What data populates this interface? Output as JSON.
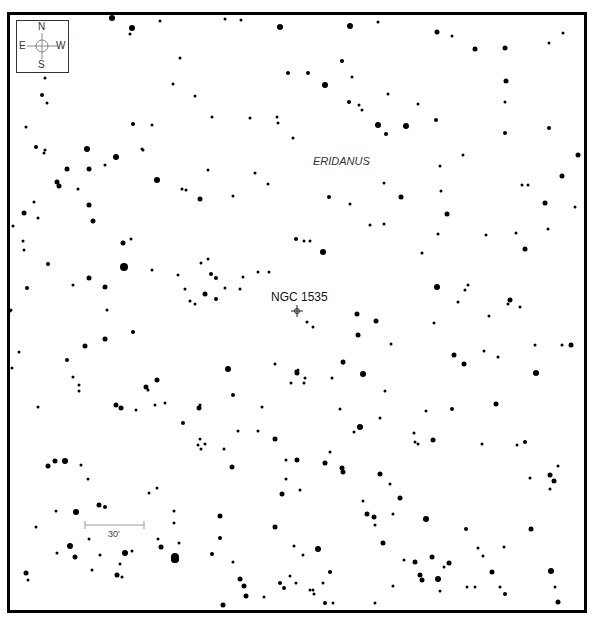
{
  "map": {
    "type": "finder_chart",
    "object_name": "NGC 1535",
    "object_pos": [
      297,
      311
    ],
    "constellation": "ERIDANUS",
    "constellation_pos": [
      313,
      162
    ],
    "frame": {
      "left": 7,
      "top": 12,
      "right": 586,
      "bottom": 610,
      "border_px": 3
    },
    "compass": {
      "north": "N",
      "south": "S",
      "east": "E",
      "west": "W",
      "center": [
        41,
        46
      ]
    },
    "scale_bar": {
      "label": "30'",
      "x1": 85,
      "x2": 144,
      "y": 525
    },
    "stars": [
      [
        112,
        18,
        3
      ],
      [
        132,
        28,
        3
      ],
      [
        130,
        34,
        1.5
      ],
      [
        160,
        21,
        1.5
      ],
      [
        225,
        19,
        1.5
      ],
      [
        241,
        20,
        1.5
      ],
      [
        280,
        27,
        3
      ],
      [
        350,
        26,
        3
      ],
      [
        378,
        22,
        1.5
      ],
      [
        437,
        32,
        2.5
      ],
      [
        452,
        36,
        1.5
      ],
      [
        549,
        43,
        1.5
      ],
      [
        563,
        33,
        1.5
      ],
      [
        45,
        78,
        1.5
      ],
      [
        42,
        95,
        2
      ],
      [
        47,
        103,
        1.5
      ],
      [
        26,
        127,
        1.5
      ],
      [
        36,
        147,
        2
      ],
      [
        44,
        153,
        1.5
      ],
      [
        87,
        149,
        3
      ],
      [
        116,
        157,
        3
      ],
      [
        133,
        124,
        2
      ],
      [
        142,
        149,
        1.5
      ],
      [
        143,
        150,
        1.5
      ],
      [
        152,
        125,
        1.5
      ],
      [
        180,
        58,
        1.5
      ],
      [
        173,
        84,
        1.5
      ],
      [
        195,
        96,
        1.5
      ],
      [
        212,
        117,
        1.5
      ],
      [
        250,
        118,
        1.5
      ],
      [
        277,
        117,
        1.5
      ],
      [
        278,
        123,
        1.5
      ],
      [
        288,
        73,
        2
      ],
      [
        308,
        73,
        2
      ],
      [
        325,
        85,
        3
      ],
      [
        342,
        61,
        2
      ],
      [
        352,
        77,
        1.5
      ],
      [
        349,
        102,
        2
      ],
      [
        359,
        105,
        1.5
      ],
      [
        362,
        110,
        1.5
      ],
      [
        388,
        94,
        1.5
      ],
      [
        378,
        125,
        3
      ],
      [
        386,
        134,
        2
      ],
      [
        406,
        126,
        3
      ],
      [
        418,
        104,
        1.5
      ],
      [
        436,
        120,
        2
      ],
      [
        475,
        49,
        2.5
      ],
      [
        505,
        48,
        2.5
      ],
      [
        506,
        81,
        2.5
      ],
      [
        505,
        102,
        1.5
      ],
      [
        505,
        133,
        2
      ],
      [
        549,
        128,
        2
      ],
      [
        578,
        155,
        2.5
      ],
      [
        45,
        150,
        1.5
      ],
      [
        67,
        169,
        2.5
      ],
      [
        57,
        182,
        2.5
      ],
      [
        59,
        186,
        2.5
      ],
      [
        89,
        169,
        2.5
      ],
      [
        89,
        205,
        2.5
      ],
      [
        93,
        221,
        2.5
      ],
      [
        105,
        165,
        1.5
      ],
      [
        78,
        189,
        1.5
      ],
      [
        34,
        202,
        1.5
      ],
      [
        24,
        213,
        2.5
      ],
      [
        38,
        218,
        1.5
      ],
      [
        13,
        226,
        1.5
      ],
      [
        23,
        241,
        1.5
      ],
      [
        157,
        180,
        3
      ],
      [
        182,
        189,
        1.5
      ],
      [
        186,
        190,
        1.5
      ],
      [
        200,
        199,
        2.5
      ],
      [
        208,
        170,
        1.5
      ],
      [
        255,
        173,
        1.5
      ],
      [
        268,
        184,
        1.5
      ],
      [
        233,
        196,
        1.5
      ],
      [
        329,
        197,
        2
      ],
      [
        350,
        204,
        1.5
      ],
      [
        384,
        183,
        1.5
      ],
      [
        401,
        197,
        2.5
      ],
      [
        441,
        191,
        1.5
      ],
      [
        440,
        166,
        1.5
      ],
      [
        463,
        155,
        1.5
      ],
      [
        522,
        185,
        1.5
      ],
      [
        528,
        185,
        1.5
      ],
      [
        545,
        203,
        2.5
      ],
      [
        562,
        176,
        2.5
      ],
      [
        575,
        207,
        1.5
      ],
      [
        447,
        214,
        2.5
      ],
      [
        293,
        138,
        1.5
      ],
      [
        24,
        250,
        1.5
      ],
      [
        27,
        288,
        2
      ],
      [
        48,
        264,
        2
      ],
      [
        73,
        285,
        1.5
      ],
      [
        89,
        278,
        2.5
      ],
      [
        105,
        287,
        2.5
      ],
      [
        124,
        267,
        4
      ],
      [
        123,
        243,
        2.5
      ],
      [
        131,
        239,
        1.5
      ],
      [
        152,
        270,
        1.5
      ],
      [
        178,
        275,
        1.5
      ],
      [
        185,
        289,
        1.5
      ],
      [
        201,
        263,
        1.5
      ],
      [
        208,
        259,
        1.5
      ],
      [
        211,
        274,
        2
      ],
      [
        216,
        278,
        2
      ],
      [
        225,
        288,
        1.5
      ],
      [
        243,
        277,
        1.5
      ],
      [
        258,
        272,
        1.5
      ],
      [
        269,
        272,
        1.5
      ],
      [
        216,
        299,
        2
      ],
      [
        205,
        294,
        2.5
      ],
      [
        190,
        301,
        1.5
      ],
      [
        195,
        304,
        1.5
      ],
      [
        240,
        289,
        1.5
      ],
      [
        296,
        239,
        2
      ],
      [
        304,
        241,
        1.5
      ],
      [
        310,
        241,
        1.5
      ],
      [
        323,
        252,
        3
      ],
      [
        370,
        225,
        1.5
      ],
      [
        384,
        224,
        1.5
      ],
      [
        438,
        234,
        1.5
      ],
      [
        422,
        253,
        1.5
      ],
      [
        486,
        235,
        1.5
      ],
      [
        516,
        233,
        1.5
      ],
      [
        525,
        249,
        2.5
      ],
      [
        548,
        229,
        1.5
      ],
      [
        437,
        287,
        3
      ],
      [
        465,
        290,
        1.5
      ],
      [
        468,
        285,
        1.5
      ],
      [
        458,
        302,
        1.5
      ],
      [
        510,
        300,
        2.5
      ],
      [
        11,
        310,
        1.5
      ],
      [
        10,
        311,
        1.5
      ],
      [
        19,
        352,
        1.5
      ],
      [
        12,
        368,
        1.5
      ],
      [
        38,
        407,
        1.5
      ],
      [
        67,
        360,
        2
      ],
      [
        73,
        377,
        1.5
      ],
      [
        79,
        385,
        1.5
      ],
      [
        79,
        391,
        1.5
      ],
      [
        85,
        346,
        2.5
      ],
      [
        105,
        339,
        2.5
      ],
      [
        107,
        310,
        1.5
      ],
      [
        133,
        332,
        2
      ],
      [
        146,
        387,
        2.5
      ],
      [
        157,
        380,
        2.5
      ],
      [
        148,
        390,
        1.5
      ],
      [
        155,
        405,
        1.5
      ],
      [
        165,
        403,
        1.5
      ],
      [
        116,
        405,
        2.5
      ],
      [
        121,
        408,
        2.5
      ],
      [
        136,
        410,
        1.5
      ],
      [
        199,
        408,
        2.5
      ],
      [
        200,
        405,
        1.5
      ],
      [
        183,
        423,
        2
      ],
      [
        200,
        439,
        1.5
      ],
      [
        198,
        445,
        1.5
      ],
      [
        201,
        449,
        1.5
      ],
      [
        205,
        444,
        1.5
      ],
      [
        224,
        449,
        1.5
      ],
      [
        228,
        369,
        3
      ],
      [
        233,
        395,
        2
      ],
      [
        238,
        431,
        1.5
      ],
      [
        258,
        431,
        1.5
      ],
      [
        275,
        439,
        2.5
      ],
      [
        297,
        373,
        2.5
      ],
      [
        298,
        370,
        1.5
      ],
      [
        305,
        378,
        1.5
      ],
      [
        275,
        364,
        1.5
      ],
      [
        296,
        371,
        1.5
      ],
      [
        307,
        322,
        1.5
      ],
      [
        313,
        327,
        1.5
      ],
      [
        357,
        314,
        2.5
      ],
      [
        358,
        335,
        2.5
      ],
      [
        376,
        321,
        2.5
      ],
      [
        343,
        362,
        2.5
      ],
      [
        343,
        363,
        1.5
      ],
      [
        363,
        374,
        3
      ],
      [
        332,
        378,
        1.5
      ],
      [
        391,
        344,
        1.5
      ],
      [
        434,
        323,
        1.5
      ],
      [
        454,
        355,
        2.5
      ],
      [
        464,
        364,
        2.5
      ],
      [
        484,
        351,
        1.5
      ],
      [
        498,
        357,
        1.5
      ],
      [
        536,
        373,
        3
      ],
      [
        535,
        345,
        1.5
      ],
      [
        562,
        345,
        1.5
      ],
      [
        571,
        345,
        2.5
      ],
      [
        489,
        316,
        1.5
      ],
      [
        520,
        307,
        1.5
      ],
      [
        508,
        304,
        1.5
      ],
      [
        496,
        404,
        2.5
      ],
      [
        426,
        411,
        1.5
      ],
      [
        380,
        418,
        1.5
      ],
      [
        340,
        409,
        1.5
      ],
      [
        360,
        427,
        3
      ],
      [
        354,
        432,
        1.5
      ],
      [
        452,
        409,
        2
      ],
      [
        433,
        440,
        2.5
      ],
      [
        418,
        444,
        1.5
      ],
      [
        414,
        433,
        1.5
      ],
      [
        482,
        444,
        1.5
      ],
      [
        517,
        445,
        1.5
      ],
      [
        525,
        442,
        2
      ],
      [
        262,
        407,
        1.5
      ],
      [
        385,
        391,
        1.5
      ],
      [
        304,
        383,
        1.5
      ],
      [
        291,
        383,
        1.5
      ],
      [
        48,
        466,
        2.5
      ],
      [
        55,
        461,
        2.5
      ],
      [
        65,
        461,
        3
      ],
      [
        81,
        465,
        1.5
      ],
      [
        88,
        479,
        1.5
      ],
      [
        56,
        511,
        1.5
      ],
      [
        76,
        512,
        3
      ],
      [
        99,
        505,
        2.5
      ],
      [
        105,
        507,
        2
      ],
      [
        36,
        527,
        1.5
      ],
      [
        70,
        546,
        3
      ],
      [
        57,
        553,
        1.5
      ],
      [
        75,
        557,
        2.5
      ],
      [
        89,
        539,
        1.5
      ],
      [
        100,
        555,
        1.5
      ],
      [
        125,
        553,
        3
      ],
      [
        132,
        551,
        1.5
      ],
      [
        92,
        570,
        1.5
      ],
      [
        117,
        575,
        2.5
      ],
      [
        122,
        577,
        1.5
      ],
      [
        26,
        573,
        2.5
      ],
      [
        28,
        580,
        1.5
      ],
      [
        149,
        493,
        1.5
      ],
      [
        157,
        488,
        1.5
      ],
      [
        174,
        511,
        1.5
      ],
      [
        174,
        523,
        1.5
      ],
      [
        158,
        539,
        1.5
      ],
      [
        161,
        547,
        2.5
      ],
      [
        179,
        543,
        1.5
      ],
      [
        175,
        559,
        4
      ],
      [
        175,
        559,
        4
      ],
      [
        232,
        467,
        2.5
      ],
      [
        220,
        516,
        2.5
      ],
      [
        220,
        538,
        2
      ],
      [
        212,
        554,
        2
      ],
      [
        233,
        562,
        1.5
      ],
      [
        240,
        579,
        2.5
      ],
      [
        246,
        596,
        2.5
      ],
      [
        264,
        597,
        1.5
      ],
      [
        286,
        460,
        1.5
      ],
      [
        297,
        460,
        2.5
      ],
      [
        300,
        490,
        1.5
      ],
      [
        325,
        463,
        2.5
      ],
      [
        343,
        472,
        2.5
      ],
      [
        363,
        501,
        1.5
      ],
      [
        367,
        514,
        2.5
      ],
      [
        380,
        474,
        2.5
      ],
      [
        390,
        484,
        1.5
      ],
      [
        393,
        514,
        1.5
      ],
      [
        286,
        479,
        1.5
      ],
      [
        282,
        494,
        2.5
      ],
      [
        275,
        527,
        2.5
      ],
      [
        294,
        546,
        1.5
      ],
      [
        318,
        549,
        3
      ],
      [
        330,
        572,
        2
      ],
      [
        323,
        583,
        1.5
      ],
      [
        303,
        555,
        1.5
      ],
      [
        296,
        583,
        1.5
      ],
      [
        314,
        594,
        1.5
      ],
      [
        313,
        590,
        1.5
      ],
      [
        325,
        603,
        2
      ],
      [
        374,
        517,
        2.5
      ],
      [
        375,
        525,
        1.5
      ],
      [
        383,
        543,
        2.5
      ],
      [
        404,
        560,
        1.5
      ],
      [
        415,
        562,
        2.5
      ],
      [
        432,
        557,
        2.5
      ],
      [
        444,
        567,
        1.5
      ],
      [
        440,
        591,
        1.5
      ],
      [
        393,
        586,
        1.5
      ],
      [
        420,
        575,
        2.5
      ],
      [
        422,
        580,
        2.5
      ],
      [
        438,
        579,
        3
      ],
      [
        449,
        563,
        2.5
      ],
      [
        467,
        587,
        1.5
      ],
      [
        475,
        587,
        1.5
      ],
      [
        492,
        572,
        2.5
      ],
      [
        505,
        594,
        2
      ],
      [
        415,
        442,
        1.5
      ],
      [
        330,
        452,
        1.5
      ],
      [
        342,
        468,
        2.5
      ],
      [
        400,
        498,
        2.5
      ],
      [
        426,
        519,
        3
      ],
      [
        466,
        529,
        2
      ],
      [
        478,
        548,
        1.5
      ],
      [
        483,
        556,
        1.5
      ],
      [
        500,
        587,
        1.5
      ],
      [
        530,
        478,
        1.5
      ],
      [
        550,
        475,
        2.5
      ],
      [
        554,
        481,
        2.5
      ],
      [
        558,
        466,
        1.5
      ],
      [
        550,
        489,
        1.5
      ],
      [
        531,
        529,
        2.5
      ],
      [
        504,
        547,
        1.5
      ],
      [
        551,
        571,
        3
      ],
      [
        555,
        587,
        1.5
      ],
      [
        558,
        602,
        2.5
      ],
      [
        375,
        603,
        1.5
      ],
      [
        333,
        603,
        1.5
      ],
      [
        310,
        590,
        1.5
      ],
      [
        280,
        583,
        2
      ],
      [
        290,
        576,
        1.5
      ],
      [
        284,
        588,
        2
      ],
      [
        223,
        605,
        2.5
      ],
      [
        244,
        586,
        2.5
      ],
      [
        175,
        557,
        4
      ],
      [
        120,
        564,
        1.5
      ]
    ]
  },
  "footer": {
    "text": ""
  }
}
